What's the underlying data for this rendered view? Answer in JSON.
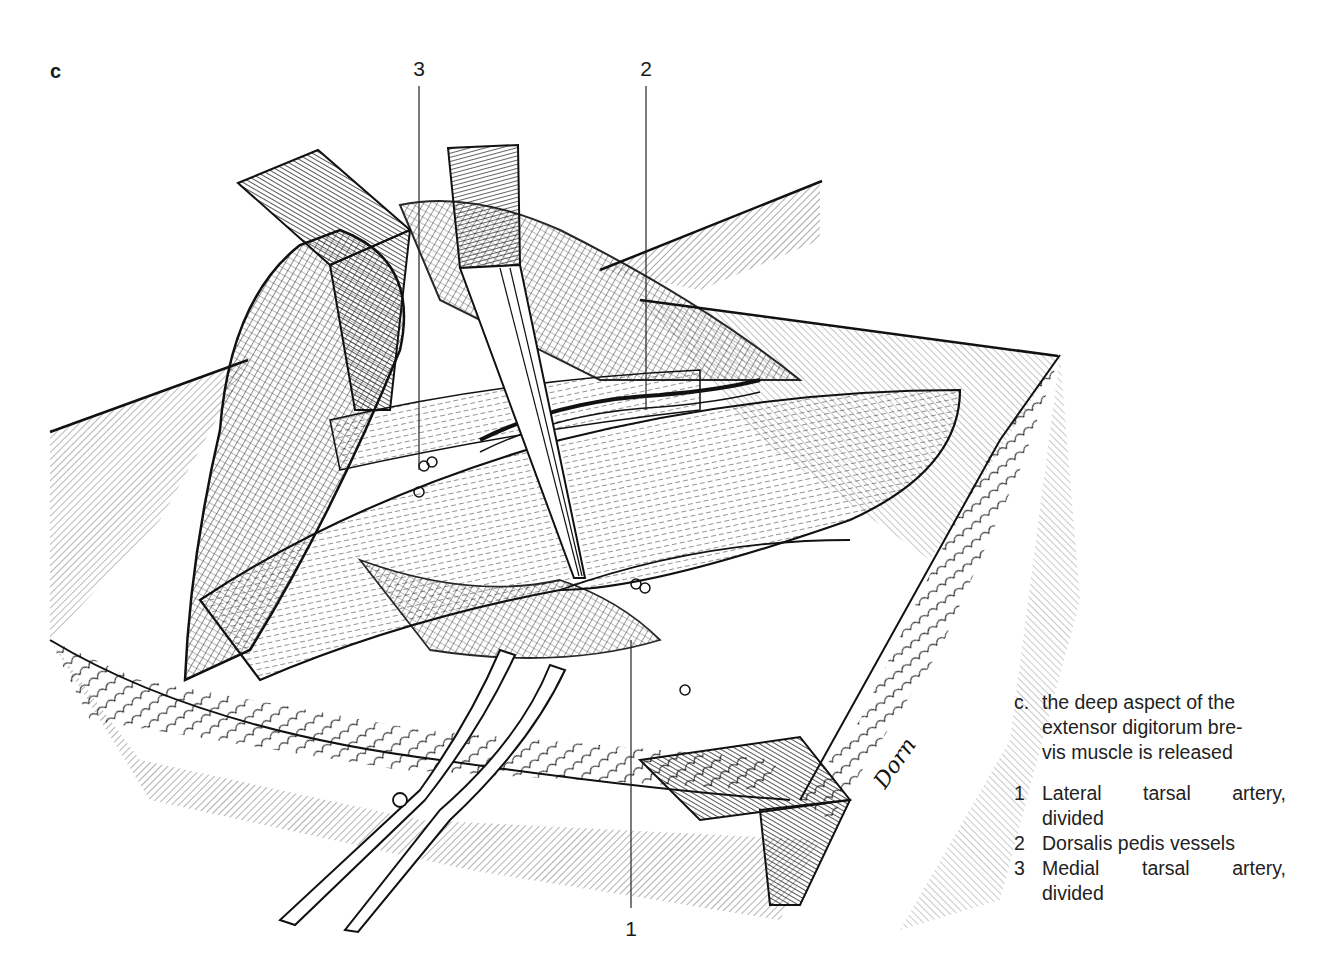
{
  "figure": {
    "panel_letter": "c",
    "callouts": [
      {
        "number": "3",
        "label_x": 419,
        "label_y": 58,
        "line_x": 419,
        "line_top": 86,
        "line_bottom": 470
      },
      {
        "number": "2",
        "label_x": 646,
        "label_y": 58,
        "line_x": 646,
        "line_top": 86,
        "line_bottom": 410
      },
      {
        "number": "1",
        "label_x": 631,
        "label_y": 918,
        "line_x": 631,
        "line_top": 640,
        "line_bottom": 908
      }
    ],
    "signature": "Dorn"
  },
  "caption": {
    "marker": "c.",
    "text_lines": [
      "the deep aspect of the",
      "extensor digitorum bre-",
      "vis muscle is released"
    ]
  },
  "legend": [
    {
      "number": "1",
      "line1": "Lateral tarsal artery,",
      "line2": "divided"
    },
    {
      "number": "2",
      "line1": "Dorsalis pedis vessels",
      "line2": ""
    },
    {
      "number": "3",
      "line1": "Medial tarsal artery,",
      "line2": "divided"
    }
  ],
  "colors": {
    "ink": "#1a1a1a",
    "paper": "#ffffff",
    "caption_text": "#222222"
  }
}
